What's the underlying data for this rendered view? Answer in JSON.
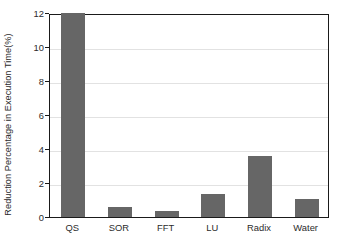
{
  "chart_data": {
    "type": "bar",
    "title": "",
    "subtitle": "",
    "xlabel": "",
    "ylabel": "Reduction Percentage in Execution Time(%)",
    "categories": [
      "QS",
      "SOR",
      "FFT",
      "LU",
      "Radix",
      "Water"
    ],
    "values": [
      12,
      0.6,
      0.37,
      1.35,
      3.6,
      1.05
    ],
    "series": [
      {
        "name": "Reduction Percentage in Execution Time(%)",
        "values": [
          12,
          0.6,
          0.37,
          1.35,
          3.6,
          1.05
        ]
      }
    ],
    "ylim": [
      0,
      12
    ],
    "y_ticks": [
      0,
      2,
      4,
      6,
      8,
      10,
      12
    ],
    "y_tick_labels": [
      "0",
      "2",
      "4",
      "6",
      "8",
      "10",
      "12"
    ],
    "x_tick_labels": [
      "QS",
      "SOR",
      "FFT",
      "LU",
      "Radix",
      "Water"
    ],
    "grid": true,
    "grid_axis": "y",
    "legend": false,
    "legend_position": "none",
    "bar_color": "#666666",
    "axis_color": "#1a1a1a",
    "grid_color": "#e2e2e2",
    "background_color": "#ffffff",
    "annotations": []
  }
}
